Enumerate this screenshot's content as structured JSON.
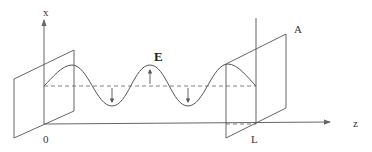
{
  "diagram": {
    "labels": {
      "x_axis": "x",
      "z_axis": "z",
      "origin": "0",
      "length": "L",
      "area": "A",
      "field": "E"
    },
    "colors": {
      "line": "#555555",
      "text": "#333333",
      "background": "#ffffff"
    },
    "elements": {
      "x_axis": {
        "x": 44,
        "y_top": 20,
        "y_bottom": 124
      },
      "z_axis": {
        "x_start": 44,
        "y": 124,
        "x_end": 330
      },
      "left_plate": [
        [
          14,
          79
        ],
        [
          74,
          50
        ],
        [
          74,
          111
        ],
        [
          14,
          138
        ]
      ],
      "right_plate": [
        [
          226,
          64
        ],
        [
          286,
          34
        ],
        [
          286,
          108
        ],
        [
          226,
          138
        ]
      ],
      "right_vertical_line": {
        "x": 256,
        "y_top": 18,
        "y_bottom": 124
      },
      "dashed_center_line": {
        "y": 86,
        "x_start": 44,
        "x_end": 256
      },
      "wave_arrows": [
        {
          "x": 112,
          "direction": "down"
        },
        {
          "x": 150,
          "direction": "up"
        },
        {
          "x": 188,
          "direction": "down"
        }
      ]
    }
  }
}
